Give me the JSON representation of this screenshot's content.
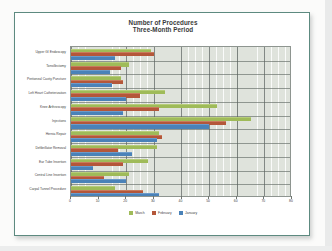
{
  "chart_data": {
    "type": "bar",
    "orientation": "horizontal",
    "title": "Number of Procedures",
    "subtitle": "Three-Month Period",
    "xlabel": "",
    "ylabel": "",
    "xlim": [
      0,
      80
    ],
    "xticks": [
      "0",
      "10",
      "20",
      "30",
      "40",
      "50",
      "60",
      "70",
      "80"
    ],
    "grid": true,
    "legend_position": "bottom",
    "categories": [
      "Upper GI Endoscopy",
      "Tonsillectomy",
      "Peritoneal Cavity Puncture",
      "Left Heart Catheterization",
      "Knee Arthroscopy",
      "Injections",
      "Hernia Repair",
      "Defibrillator Removal",
      "Ear Tube Insertion",
      "Central Line Insertion",
      "Carpal Tunnel Procedure"
    ],
    "series": [
      {
        "name": "March",
        "color": "#9fbb59",
        "values": [
          29,
          21,
          18,
          34,
          53,
          65,
          32,
          31,
          28,
          21,
          16
        ]
      },
      {
        "name": "February",
        "color": "#b4573a",
        "values": [
          30,
          18,
          19,
          25,
          32,
          56,
          33,
          17,
          19,
          12,
          26
        ]
      },
      {
        "name": "January",
        "color": "#4a82b8",
        "values": [
          16,
          14,
          15,
          20,
          19,
          50,
          31,
          22,
          8,
          20,
          32
        ]
      }
    ]
  },
  "colors": {
    "frame_border": "#5d8a80",
    "plot_background": "#dfe3dc",
    "gridline": "#5a625e",
    "card_background": "#ffffff",
    "slide_background": "#fbfbfa"
  }
}
